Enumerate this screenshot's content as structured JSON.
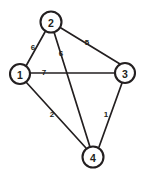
{
  "diagram": {
    "background_color": "#ffffff",
    "stroke_color": "#231f20"
  },
  "chart_data": {
    "type": "diagram",
    "graph_type": "weighted-undirected-graph",
    "nodes": [
      {
        "id": "1",
        "label": "1",
        "x": 20,
        "y": 74,
        "r": 10
      },
      {
        "id": "2",
        "label": "2",
        "x": 51,
        "y": 22,
        "r": 10.5
      },
      {
        "id": "3",
        "label": "3",
        "x": 125,
        "y": 73,
        "r": 10
      },
      {
        "id": "4",
        "label": "4",
        "x": 93,
        "y": 157,
        "r": 10.5
      }
    ],
    "edges": [
      {
        "id": "e12",
        "source": "1",
        "target": "2",
        "weight": "6",
        "x1": 26,
        "y1": 66,
        "x2": 45,
        "y2": 32,
        "lx": 33,
        "ly": 47
      },
      {
        "id": "e23",
        "source": "2",
        "target": "3",
        "weight": "5",
        "x1": 61,
        "y1": 28,
        "x2": 120,
        "y2": 64,
        "lx": 87,
        "ly": 42
      },
      {
        "id": "e24",
        "source": "2",
        "target": "4",
        "weight": "6",
        "x1": 54,
        "y1": 32,
        "x2": 90,
        "y2": 147,
        "lx": 61,
        "ly": 53
      },
      {
        "id": "e13",
        "source": "1",
        "target": "3",
        "weight": "7",
        "x1": 30,
        "y1": 73,
        "x2": 115,
        "y2": 73,
        "lx": 44,
        "ly": 72
      },
      {
        "id": "e14",
        "source": "1",
        "target": "4",
        "weight": "2",
        "x1": 26,
        "y1": 82,
        "x2": 86,
        "y2": 148,
        "lx": 52,
        "ly": 114
      },
      {
        "id": "e34",
        "source": "3",
        "target": "4",
        "weight": "1",
        "x1": 122,
        "y1": 83,
        "x2": 99,
        "y2": 147,
        "lx": 106,
        "ly": 114
      }
    ]
  }
}
